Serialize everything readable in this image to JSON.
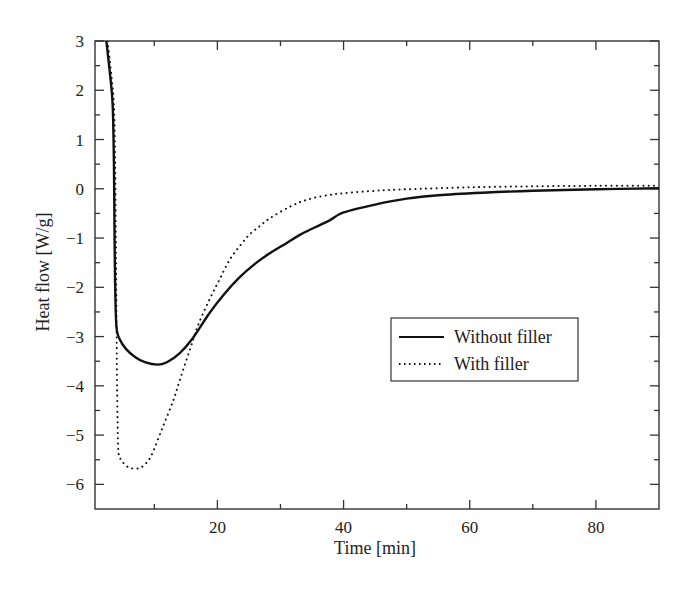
{
  "chart_data": {
    "type": "line",
    "title": "",
    "xlabel": "Time [min]",
    "ylabel": "Heat flow [W/g]",
    "xlim": [
      0.6,
      90
    ],
    "ylim": [
      -6.5,
      3
    ],
    "xticks": [
      20,
      40,
      60,
      80
    ],
    "xtick_labels": [
      "20",
      "40",
      "60",
      "80"
    ],
    "x_minor_ticks": [
      10,
      30,
      50,
      70
    ],
    "yticks": [
      3,
      2,
      1,
      0,
      -1,
      -2,
      -3,
      -4,
      -5,
      -6
    ],
    "ytick_labels": [
      "3",
      "2",
      "1",
      "0",
      "−1",
      "−2",
      "−3",
      "−4",
      "−5",
      "−6"
    ],
    "y_minor_ticks": [
      2.5,
      1.5,
      0.5,
      -0.5,
      -1.5,
      -2.5,
      -3.5,
      -4.5,
      -5.5
    ],
    "grid": false,
    "legend_position": "center-right",
    "series": [
      {
        "name": "Without filler",
        "style": "solid",
        "color": "#111111",
        "x": [
          2.4,
          3.0,
          3.4,
          3.6,
          3.7,
          3.8,
          4.0,
          4.5,
          5.5,
          7.0,
          8.5,
          10.5,
          12.0,
          14.0,
          16.0,
          18.7,
          21.0,
          23.5,
          26.0,
          28.3,
          31.0,
          33.0,
          35.5,
          37.8,
          40.0,
          45.0,
          50.0,
          55.0,
          62.0,
          70.0,
          80.0,
          90.0
        ],
        "y": [
          3.0,
          2.3,
          1.7,
          0.5,
          -1.0,
          -2.0,
          -2.8,
          -3.05,
          -3.25,
          -3.42,
          -3.52,
          -3.57,
          -3.52,
          -3.34,
          -3.05,
          -2.53,
          -2.15,
          -1.8,
          -1.52,
          -1.31,
          -1.1,
          -0.94,
          -0.78,
          -0.64,
          -0.48,
          -0.32,
          -0.2,
          -0.13,
          -0.08,
          -0.04,
          -0.01,
          0.01
        ]
      },
      {
        "name": "With filler",
        "style": "dotted",
        "color": "#111111",
        "x": [
          2.6,
          3.2,
          3.6,
          3.8,
          3.9,
          4.0,
          4.1,
          4.3,
          4.8,
          5.5,
          6.3,
          7.3,
          8.3,
          9.5,
          11.3,
          13.0,
          14.0,
          15.6,
          17.0,
          18.7,
          20.3,
          21.9,
          23.5,
          25.0,
          26.7,
          28.3,
          31.4,
          34.0,
          37.0,
          40.0,
          45.0,
          50.0,
          60.0,
          70.0,
          80.0,
          90.0
        ],
        "y": [
          3.0,
          2.3,
          1.7,
          0.5,
          -1.0,
          -2.5,
          -4.0,
          -5.3,
          -5.5,
          -5.62,
          -5.67,
          -5.68,
          -5.62,
          -5.42,
          -4.85,
          -4.3,
          -3.9,
          -3.28,
          -2.75,
          -2.26,
          -1.85,
          -1.45,
          -1.17,
          -0.94,
          -0.76,
          -0.6,
          -0.37,
          -0.23,
          -0.14,
          -0.09,
          -0.04,
          -0.01,
          0.03,
          0.05,
          0.06,
          0.06
        ]
      }
    ]
  }
}
